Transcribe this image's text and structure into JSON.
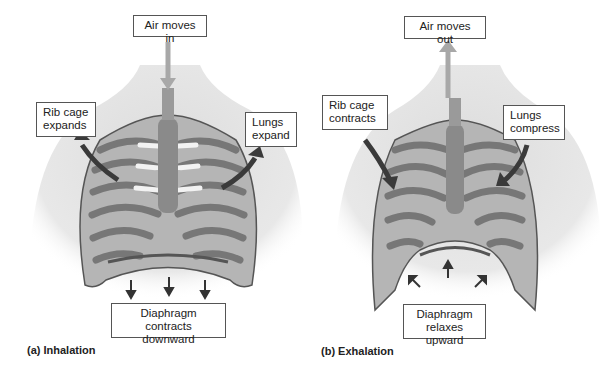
{
  "panels": [
    {
      "caption": "(a) Inhalation",
      "labels": {
        "air": "Air moves in",
        "rib_line1": "Rib cage",
        "rib_line2": "expands",
        "lungs_line1": "Lungs",
        "lungs_line2": "expand",
        "diaphragm_line1": "Diaphragm",
        "diaphragm_line2": "contracts downward"
      }
    },
    {
      "caption": "(b) Exhalation",
      "labels": {
        "air": "Air moves out",
        "rib_line1": "Rib cage",
        "rib_line2": "contracts",
        "lungs_line1": "Lungs",
        "lungs_line2": "compress",
        "diaphragm_line1": "Diaphragm",
        "diaphragm_line2": "relaxes upward"
      }
    }
  ],
  "colors": {
    "air_arrow": "#a8a8a8",
    "motion_arrow": "#3a3a3a",
    "body": "#e4e4e4",
    "rib": "#8c8c8c",
    "cartilage": "#f2f2f2",
    "trachea": "#8a8a8a"
  }
}
